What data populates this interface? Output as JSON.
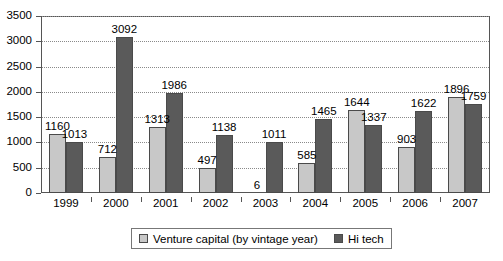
{
  "chart_data": {
    "type": "bar",
    "title": "",
    "subtitle": "",
    "xlabel": "",
    "ylabel": "",
    "categories": [
      "1999",
      "2000",
      "2001",
      "2002",
      "2003",
      "2004",
      "2005",
      "2006",
      "2007"
    ],
    "series": [
      {
        "name": "Venture capital (by vintage year)",
        "color": "#c8c8c8",
        "values": [
          1160,
          712,
          1313,
          497,
          6,
          585,
          1644,
          903,
          1896
        ]
      },
      {
        "name": "Hi tech",
        "color": "#5a5a5a",
        "values": [
          1013,
          3092,
          1986,
          1138,
          1011,
          1465,
          1337,
          1622,
          1759
        ]
      }
    ],
    "ylim": [
      0,
      3500
    ],
    "y_ticks": [
      0,
      500,
      1000,
      1500,
      2000,
      2500,
      3000,
      3500
    ],
    "y_tick_labels": [
      "0",
      "500",
      "1000",
      "1500",
      "2000",
      "2500",
      "3000",
      "3500"
    ],
    "grid": true,
    "grid_style": "dotted",
    "legend_position": "bottom",
    "data_labels": true
  },
  "legend": {
    "entries": [
      {
        "label": "Venture capital (by vintage year)"
      },
      {
        "label": "Hi tech"
      }
    ]
  },
  "colors": {
    "series_vc": "#c8c8c8",
    "series_ht": "#5a5a5a",
    "axis": "#555555",
    "grid": "#8a8a8a",
    "background": "#ffffff",
    "text": "#000000"
  }
}
